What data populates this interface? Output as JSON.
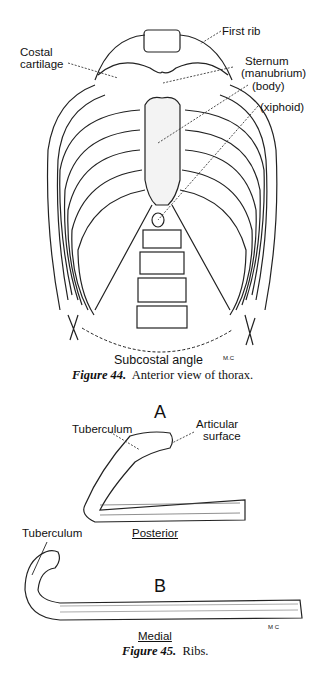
{
  "figure44": {
    "labels": {
      "first_rib": "First rib",
      "costal_cartilage_1": "Costal",
      "costal_cartilage_2": "cartilage",
      "sternum": "Sternum",
      "manubrium": "(manubrium)",
      "body": "(body)",
      "xiphoid": "(xiphoid)",
      "subcostal_angle": "Subcostal angle",
      "initials": "M.C"
    },
    "caption_prefix": "Figure 44.",
    "caption_text": "Anterior view of thorax."
  },
  "figure45": {
    "panel_a": {
      "letter": "A",
      "tuberculum": "Tuberculum",
      "articular_1": "Articular",
      "articular_2": "surface",
      "view": "Posterior"
    },
    "panel_b": {
      "letter": "B",
      "tuberculum": "Tuberculum",
      "view": "Medial",
      "initials": "M C"
    },
    "caption_prefix": "Figure 45.",
    "caption_text": "Ribs."
  }
}
